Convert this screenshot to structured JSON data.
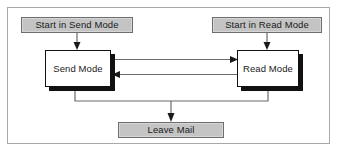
{
  "figure": {
    "type": "flowchart",
    "frame": {
      "border_color": "#a8a8a8",
      "background": "#ffffff"
    }
  },
  "colors": {
    "terminal_fill": "#c4c4c4",
    "terminal_border": "#6e6e6e",
    "state_fill": "#ffffff",
    "state_border": "#111111",
    "state_shadow": "#111111",
    "connector": "#6b6b6b",
    "arrowhead": "#1a1a1a",
    "text": "#1a1a1a"
  },
  "nodes": [
    {
      "id": "start-send",
      "label": "Start in Send Mode",
      "shape": "terminal"
    },
    {
      "id": "start-read",
      "label": "Start in Read Mode",
      "shape": "terminal"
    },
    {
      "id": "send-mode",
      "label": "Send Mode",
      "shape": "state"
    },
    {
      "id": "read-mode",
      "label": "Read Mode",
      "shape": "state"
    },
    {
      "id": "leave-mail",
      "label": "Leave Mail",
      "shape": "terminal"
    }
  ],
  "edges": [
    {
      "id": "e1",
      "from": "start-send",
      "to": "send-mode",
      "direction": "down",
      "label": ""
    },
    {
      "id": "e2",
      "from": "start-read",
      "to": "read-mode",
      "direction": "down",
      "label": ""
    },
    {
      "id": "e3",
      "from": "send-mode",
      "to": "read-mode",
      "direction": "right",
      "label": ""
    },
    {
      "id": "e4",
      "from": "read-mode",
      "to": "send-mode",
      "direction": "left",
      "label": ""
    },
    {
      "id": "e5",
      "from": "send-mode",
      "to": "leave-mail",
      "direction": "down",
      "label": ""
    },
    {
      "id": "e6",
      "from": "read-mode",
      "to": "leave-mail",
      "direction": "down",
      "label": ""
    }
  ]
}
